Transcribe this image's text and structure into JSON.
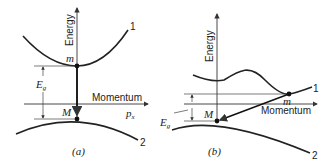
{
  "panels": [
    {
      "id": "a",
      "caption": "(a)",
      "y_axis_label": "Energy",
      "x_axis_label": "Momentum",
      "x_axis_symbol": "p",
      "x_axis_symbol_sub": "x",
      "band_upper_label": "1",
      "band_lower_label": "2",
      "point_upper_label": "m",
      "point_lower_label": "M",
      "gap_label": "E",
      "gap_label_sub": "g",
      "transition": "direct"
    },
    {
      "id": "b",
      "caption": "(b)",
      "y_axis_label": "Energy",
      "x_axis_label": "Momentum",
      "band_upper_label": "1",
      "band_lower_label": "2",
      "point_upper_label": "m",
      "point_lower_label": "M",
      "gap_label": "E",
      "gap_label_sub": "g",
      "transition": "indirect"
    }
  ]
}
